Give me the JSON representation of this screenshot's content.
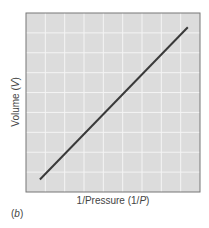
{
  "chart_data": {
    "type": "line",
    "title": "",
    "xlabel": "1/Pressure (1/P)",
    "ylabel": "Volume (V)",
    "panel_label": "(b)",
    "grid": true,
    "grid_cols": 9,
    "grid_rows": 9,
    "xlim": [
      0,
      1
    ],
    "ylim": [
      0,
      1
    ],
    "series": [
      {
        "name": "V vs 1/P",
        "x": [
          0.08,
          0.93
        ],
        "y": [
          0.07,
          0.92
        ]
      }
    ],
    "colors": {
      "plot_bg": "#dcdcdc",
      "grid": "#f4f4f4",
      "frame": "#777777",
      "line": "#3a3a3a"
    }
  },
  "labels": {
    "x_prefix": "1/Pressure (1/",
    "x_var": "P",
    "x_suffix": ")",
    "y_prefix": "Volume (",
    "y_var": "V",
    "y_suffix": ")",
    "panel": "(b)"
  }
}
